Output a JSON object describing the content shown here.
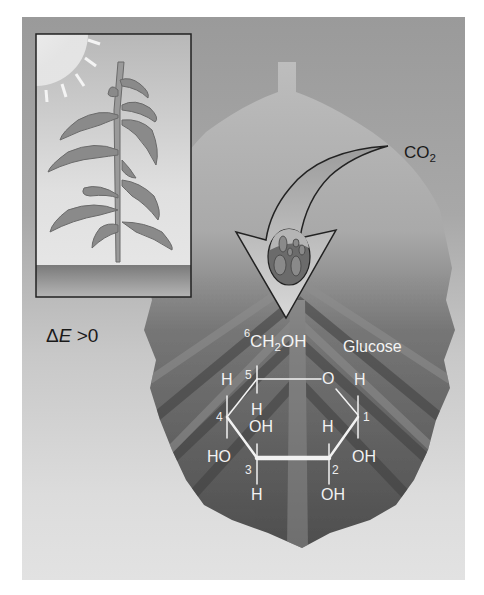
{
  "figure": {
    "colors": {
      "background": "#ffffff",
      "panel": "#a8a8a8",
      "leaf_dark": "#555555",
      "leaf_light": "#bdbdbd",
      "arrow_fill": "#c9c9c9",
      "label_dark": "#1a1a1a",
      "label_light": "#f2f2f2"
    }
  },
  "inset": {
    "description": "Plant growing in sunlight",
    "icons": [
      "sun-icon",
      "plant-icon",
      "ground"
    ]
  },
  "energy_label": {
    "delta": "Δ",
    "symbol": "E",
    "relation": " >0"
  },
  "co2_label": {
    "base": "CO",
    "subscript": "2"
  },
  "glucose": {
    "title": "Glucose",
    "c6_number": "6",
    "ch2oh": {
      "a": "CH",
      "sub": "2",
      "b": "OH"
    },
    "ring_numbers": {
      "c1": "1",
      "c2": "2",
      "c3": "3",
      "c4": "4",
      "c5": "5"
    },
    "ring_oxygen": "O",
    "substituents": {
      "c5_top": "H",
      "c1_top": "H",
      "c4_top": "H",
      "c4_bottom_OH": "OH",
      "c1_bottom_H": "H",
      "c1_right_OH": "OH",
      "c4_left_HO": "HO",
      "c3_bottom": "H",
      "c2_bottom": "OH"
    }
  }
}
